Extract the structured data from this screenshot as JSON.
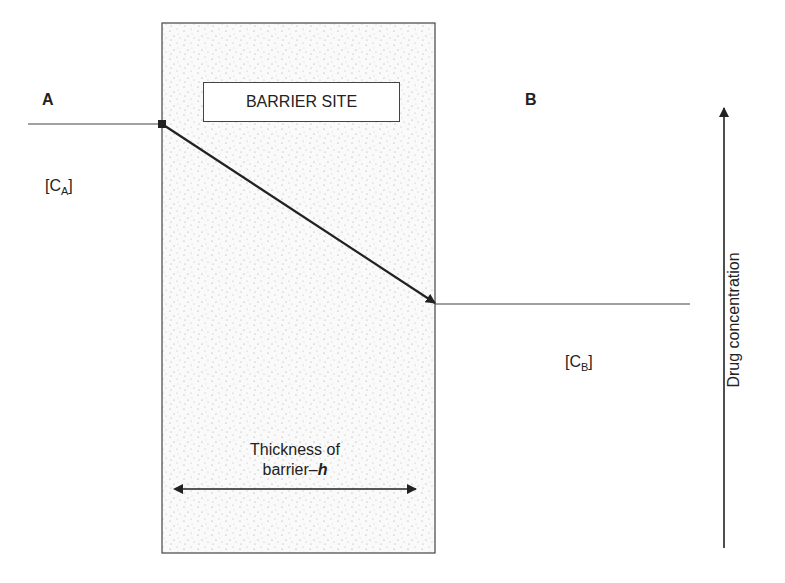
{
  "diagram": {
    "labels": {
      "compartment_a": "A",
      "compartment_b": "B",
      "barrier_title": "BARRIER SITE",
      "conc_a_base": "[C",
      "conc_a_sub": "A",
      "conc_a_end": "]",
      "conc_b_base": "[C",
      "conc_b_sub": "B",
      "conc_b_end": "]",
      "thickness_line1": "Thickness of",
      "thickness_line2_prefix": "barrier–",
      "thickness_symbol": "h",
      "axis_label": "Drug concentration"
    },
    "colors": {
      "line": "#222222",
      "barrier_fill": "#f7f7f7",
      "stipple": "#9a9a9a"
    }
  }
}
